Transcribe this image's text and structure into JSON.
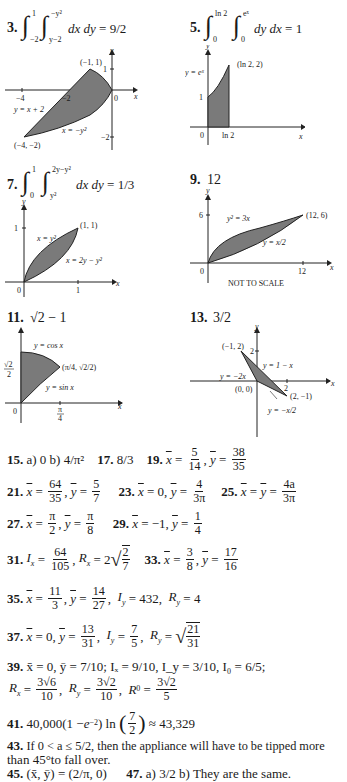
{
  "problems": {
    "p3": {
      "number": "3.",
      "integral": {
        "outer_lower": "−2",
        "outer_upper": "1",
        "inner_lower": "y−2",
        "inner_upper": "−y²",
        "integrand": "dx dy",
        "result": "= 9/2"
      },
      "graph": {
        "labels": [
          "(−1, 1)",
          "y",
          "x",
          "1",
          "−4",
          "−2",
          "0",
          "y = x + 2",
          "x = −y²",
          "−2",
          "(−4, −2)"
        ]
      }
    },
    "p5": {
      "number": "5.",
      "integral": {
        "outer_lower": "0",
        "outer_upper": "ln 2",
        "inner_lower": "0",
        "inner_upper": "eˣ",
        "integrand": "dy dx",
        "result": "= 1"
      },
      "graph": {
        "labels": [
          "y",
          "(ln 2, 2)",
          "y = eˣ",
          "1",
          "0",
          "ln 2",
          "x"
        ]
      }
    },
    "p7": {
      "number": "7.",
      "integral": {
        "outer_lower": "0",
        "outer_upper": "1",
        "inner_lower": "y²",
        "inner_upper": "2y−y²",
        "integrand": "dx dy",
        "result": "= 1/3"
      },
      "graph": {
        "labels": [
          "y",
          "1",
          "(1, 1)",
          "x = y²",
          "x = 2y − y²",
          "0",
          "1",
          "x"
        ]
      }
    },
    "p9": {
      "number": "9.",
      "answer": "12",
      "graph": {
        "labels": [
          "y",
          "6",
          "y² = 3x",
          "(12, 6)",
          "y = x/2",
          "0",
          "12",
          "x",
          "NOT TO SCALE"
        ]
      }
    },
    "p11": {
      "number": "11.",
      "answer": "√2 − 1",
      "graph": {
        "labels": [
          "y",
          "y = cos x",
          "√2/2",
          "(π/4, √2/2)",
          "y = sin x",
          "0",
          "π/4",
          "x"
        ]
      }
    },
    "p13": {
      "number": "13.",
      "answer": "3/2",
      "graph": {
        "labels": [
          "y",
          "(−1, 2)",
          "2",
          "y = 1 − x",
          "y = −2x",
          "x",
          "(0, 0)",
          "2",
          "(2, −1)",
          "y = −x/2"
        ]
      }
    }
  },
  "answers": {
    "a15": {
      "number": "15.",
      "text": "a) 0   b) 4/π²"
    },
    "a17": {
      "number": "17.",
      "text": "8/3"
    },
    "a19": {
      "number": "19.",
      "xbar": "5/14",
      "ybar": "38/35"
    },
    "a21": {
      "number": "21.",
      "xbar": "64/35",
      "ybar": "5/7"
    },
    "a23": {
      "number": "23.",
      "xbar": "0",
      "ybar": "4/(3π)"
    },
    "a25": {
      "number": "25.",
      "xbar_eq_ybar": "4a/(3π)"
    },
    "a27": {
      "number": "27.",
      "xbar": "π/2",
      "ybar": "π/8"
    },
    "a29": {
      "number": "29.",
      "xbar": "−1",
      "ybar": "1/4"
    },
    "a31": {
      "number": "31.",
      "Ix": "64/105",
      "Rx": "2√(2/7)"
    },
    "a33": {
      "number": "33.",
      "xbar": "3/8",
      "ybar": "17/16"
    },
    "a35": {
      "number": "35.",
      "xbar": "11/3",
      "ybar": "14/27",
      "Iy": "432",
      "Ry": "4"
    },
    "a37": {
      "number": "37.",
      "xbar": "0",
      "ybar": "13/31",
      "Iy": "7/5",
      "Ry": "√(21/31)"
    },
    "a39": {
      "number": "39.",
      "line1": "x̄ = 0, ȳ = 7/10; Iₓ = 9/10, I_y = 3/10, I₀ = 6/5;",
      "Rx": "3√6/10",
      "Ry": "3√2/10",
      "R0": "3√2/5"
    },
    "a41": {
      "number": "41.",
      "text": "40,000(1 − e⁻²) ln (7/2) ≈ 43,329"
    },
    "a43": {
      "number": "43.",
      "text_line1": "If 0 < a ≤ 5/2, then the appliance will have to be tipped more",
      "text_line2": "than 45°to fall over."
    },
    "a45": {
      "number": "45.",
      "text": "(x̄, ȳ) = (2/π, 0)"
    },
    "a47": {
      "number": "47.",
      "text": "a) 3/2   b) They are the same."
    }
  }
}
